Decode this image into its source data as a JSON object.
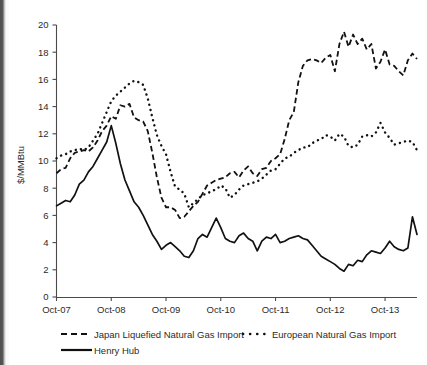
{
  "chart_data": {
    "type": "line",
    "title": "",
    "subtitle": "",
    "xlabel": "",
    "ylabel": "$/MMBtu",
    "ylim": [
      0,
      20
    ],
    "ytick_labels": [
      "0",
      "2",
      "4",
      "6",
      "8",
      "10",
      "12",
      "14",
      "16",
      "18",
      "20"
    ],
    "ytick_values": [
      0,
      2,
      4,
      6,
      8,
      10,
      12,
      14,
      16,
      18,
      20
    ],
    "xtick_labels": [
      "Oct-07",
      "Oct-08",
      "Oct-09",
      "Oct-10",
      "Oct-11",
      "Oct-12",
      "Oct-13"
    ],
    "xtick_values": [
      0,
      12,
      24,
      36,
      48,
      60,
      72
    ],
    "xlim": [
      0,
      79
    ],
    "grid": false,
    "legend_position": "below-axes",
    "x_unit": "months since Oct-2007",
    "series": [
      {
        "name": "Japan Liquefied Natural Gas Import",
        "style": "dashed",
        "color": "#111111",
        "x": [
          0,
          1,
          2,
          3,
          4,
          5,
          6,
          7,
          8,
          9,
          10,
          11,
          12,
          13,
          14,
          15,
          16,
          17,
          18,
          19,
          20,
          21,
          22,
          23,
          24,
          25,
          26,
          27,
          28,
          29,
          30,
          31,
          32,
          33,
          34,
          35,
          36,
          37,
          38,
          39,
          40,
          41,
          42,
          43,
          44,
          45,
          46,
          47,
          48,
          49,
          50,
          51,
          52,
          53,
          54,
          55,
          56,
          57,
          58,
          59,
          60,
          61,
          62,
          63,
          64,
          65,
          66,
          67,
          68,
          69,
          70,
          71,
          72,
          73,
          74,
          75,
          76,
          77,
          78,
          79
        ],
        "values": [
          9.1,
          9.4,
          9.5,
          10.2,
          10.6,
          10.7,
          10.8,
          10.7,
          11.0,
          11.5,
          12.2,
          12.6,
          13.3,
          13.1,
          14.1,
          14.0,
          14.2,
          13.2,
          13.0,
          12.9,
          12.2,
          10.6,
          8.8,
          7.3,
          6.6,
          6.6,
          6.4,
          5.8,
          5.9,
          6.3,
          6.7,
          7.0,
          7.6,
          8.2,
          8.4,
          8.6,
          8.7,
          8.8,
          9.1,
          9.2,
          8.8,
          9.3,
          9.6,
          9.1,
          8.9,
          9.4,
          9.5,
          10.0,
          10.2,
          10.5,
          11.6,
          13.0,
          13.6,
          15.8,
          17.0,
          17.4,
          17.5,
          17.4,
          17.2,
          17.6,
          17.8,
          16.6,
          18.6,
          19.5,
          18.4,
          19.3,
          18.6,
          19.0,
          18.2,
          18.6,
          16.8,
          17.3,
          18.2,
          17.1,
          17.0,
          16.6,
          16.3,
          17.4,
          17.9,
          17.5
        ]
      },
      {
        "name": "European Natural Gas Import",
        "style": "dotted",
        "color": "#111111",
        "x": [
          0,
          1,
          2,
          3,
          4,
          5,
          6,
          7,
          8,
          9,
          10,
          11,
          12,
          13,
          14,
          15,
          16,
          17,
          18,
          19,
          20,
          21,
          22,
          23,
          24,
          25,
          26,
          27,
          28,
          29,
          30,
          31,
          32,
          33,
          34,
          35,
          36,
          37,
          38,
          39,
          40,
          41,
          42,
          43,
          44,
          45,
          46,
          47,
          48,
          49,
          50,
          51,
          52,
          53,
          54,
          55,
          56,
          57,
          58,
          59,
          60,
          61,
          62,
          63,
          64,
          65,
          66,
          67,
          68,
          69,
          70,
          71,
          72,
          73,
          74,
          75,
          76,
          77,
          78,
          79
        ],
        "values": [
          10.2,
          10.4,
          10.5,
          10.7,
          10.8,
          10.9,
          10.8,
          11.0,
          11.5,
          12.0,
          12.8,
          13.6,
          14.4,
          14.8,
          15.1,
          15.4,
          15.7,
          15.9,
          15.8,
          15.6,
          14.6,
          13.2,
          11.9,
          11.1,
          10.5,
          9.2,
          8.1,
          7.9,
          7.6,
          6.6,
          6.9,
          7.2,
          7.5,
          7.6,
          7.8,
          7.9,
          8.2,
          8.0,
          7.3,
          7.5,
          7.9,
          8.2,
          8.3,
          8.4,
          8.5,
          8.7,
          9.0,
          9.3,
          9.4,
          9.8,
          10.2,
          10.3,
          10.6,
          10.8,
          11.0,
          11.0,
          11.3,
          11.5,
          11.6,
          11.9,
          11.8,
          11.5,
          12.0,
          11.8,
          11.1,
          11.0,
          11.2,
          11.8,
          11.9,
          11.8,
          12.1,
          12.8,
          12.1,
          11.7,
          11.2,
          11.3,
          11.4,
          11.5,
          11.4,
          10.8
        ]
      },
      {
        "name": "Henry Hub",
        "style": "solid",
        "color": "#111111",
        "x": [
          0,
          1,
          2,
          3,
          4,
          5,
          6,
          7,
          8,
          9,
          10,
          11,
          12,
          13,
          14,
          15,
          16,
          17,
          18,
          19,
          20,
          21,
          22,
          23,
          24,
          25,
          26,
          27,
          28,
          29,
          30,
          31,
          32,
          33,
          34,
          35,
          36,
          37,
          38,
          39,
          40,
          41,
          42,
          43,
          44,
          45,
          46,
          47,
          48,
          49,
          50,
          51,
          52,
          53,
          54,
          55,
          56,
          57,
          58,
          59,
          60,
          61,
          62,
          63,
          64,
          65,
          66,
          67,
          68,
          69,
          70,
          71,
          72,
          73,
          74,
          75,
          76,
          77,
          78,
          79
        ],
        "values": [
          6.7,
          6.9,
          7.1,
          7.0,
          7.5,
          8.3,
          8.6,
          9.2,
          9.6,
          10.2,
          10.8,
          11.4,
          12.6,
          11.3,
          9.8,
          8.6,
          7.8,
          7.0,
          6.6,
          6.0,
          5.3,
          4.6,
          4.1,
          3.5,
          3.8,
          4.0,
          3.7,
          3.4,
          3.0,
          2.9,
          3.4,
          4.3,
          4.6,
          4.4,
          5.1,
          5.8,
          5.1,
          4.3,
          4.1,
          4.0,
          4.5,
          4.7,
          4.3,
          4.1,
          3.4,
          4.1,
          4.4,
          4.3,
          4.6,
          4.0,
          4.1,
          4.3,
          4.4,
          4.5,
          4.3,
          4.2,
          3.8,
          3.4,
          3.0,
          2.8,
          2.6,
          2.4,
          2.1,
          1.9,
          2.4,
          2.3,
          2.7,
          2.6,
          3.1,
          3.4,
          3.3,
          3.2,
          3.6,
          4.1,
          3.7,
          3.5,
          3.4,
          3.6,
          5.9,
          4.6
        ]
      }
    ]
  },
  "legend": {
    "entries": [
      {
        "label": "Japan Liquefied Natural Gas Import",
        "style": "dashed"
      },
      {
        "label": "European Natural Gas Import",
        "style": "dotted"
      },
      {
        "label": "Henry Hub",
        "style": "solid"
      }
    ]
  }
}
